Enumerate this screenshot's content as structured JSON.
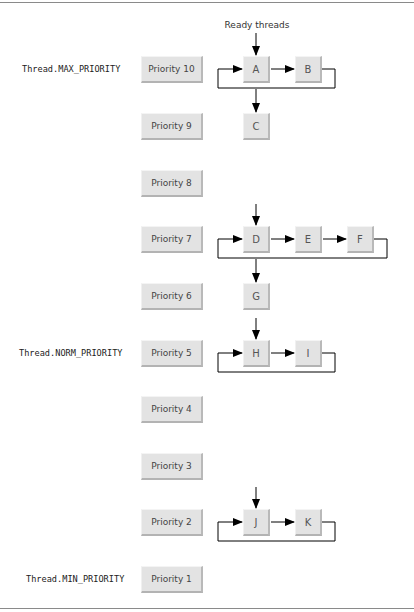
{
  "diagram": {
    "title_annotation": "Ready threads",
    "constants": {
      "max": "Thread.MAX_PRIORITY",
      "norm": "Thread.NORM_PRIORITY",
      "min": "Thread.MIN_PRIORITY"
    },
    "priorities": [
      {
        "label": "Priority 10",
        "threads": [
          "A",
          "B"
        ],
        "next_queue": [
          "C"
        ]
      },
      {
        "label": "Priority 9",
        "threads": [
          "C"
        ]
      },
      {
        "label": "Priority 8",
        "threads": []
      },
      {
        "label": "Priority 7",
        "threads": [
          "D",
          "E",
          "F"
        ],
        "next_queue": [
          "G"
        ]
      },
      {
        "label": "Priority 6",
        "threads": [
          "G"
        ]
      },
      {
        "label": "Priority 5",
        "threads": [
          "H",
          "I"
        ]
      },
      {
        "label": "Priority 4",
        "threads": []
      },
      {
        "label": "Priority 3",
        "threads": []
      },
      {
        "label": "Priority 2",
        "threads": [
          "J",
          "K"
        ]
      },
      {
        "label": "Priority 1",
        "threads": []
      }
    ],
    "threads": {
      "A": "A",
      "B": "B",
      "C": "C",
      "D": "D",
      "E": "E",
      "F": "F",
      "G": "G",
      "H": "H",
      "I": "I",
      "J": "J",
      "K": "K"
    },
    "colors": {
      "box_fill": "#e3e3e3",
      "line": "#000000",
      "rule": "#8a8a8a"
    }
  }
}
